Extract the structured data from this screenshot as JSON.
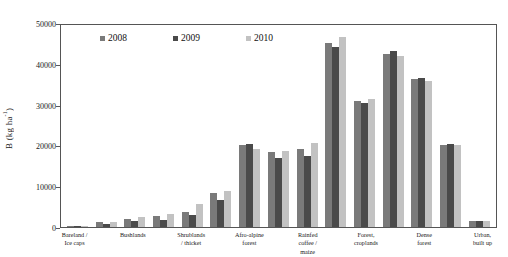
{
  "chart_data": {
    "type": "bar",
    "title": "",
    "xlabel": "",
    "ylabel": "B (kg ha-1)",
    "ylim": [
      0,
      50000
    ],
    "yticks": [
      0,
      10000,
      20000,
      30000,
      40000,
      50000
    ],
    "ytick_labels": [
      "0",
      "10000",
      "20000",
      "30000",
      "40000",
      "50000"
    ],
    "grid": false,
    "legend_position": "top-center",
    "categories": [
      "Bareland / Ice caps",
      "",
      "Bushlands",
      "",
      "Shrublands / thicket",
      "",
      "Afro-alpine forest",
      "",
      "Rainfed coffee / maize",
      "",
      "Forest, croplands",
      "",
      "Dense forest",
      "",
      "Urban, built up"
    ],
    "series": [
      {
        "name": "2008",
        "color": "#7a7a7a",
        "values": [
          150,
          1150,
          1950,
          2700,
          3800,
          8400,
          20100,
          18500,
          19100,
          45000,
          30800,
          42500,
          36200,
          20100,
          1500
        ]
      },
      {
        "name": "2009",
        "color": "#4a4a4a",
        "values": [
          120,
          700,
          1450,
          1750,
          2900,
          6500,
          20300,
          17000,
          17500,
          44200,
          30300,
          43100,
          36600,
          20400,
          1550
        ]
      },
      {
        "name": "2010",
        "color": "#c2c2c2",
        "values": [
          160,
          1300,
          2350,
          3150,
          5700,
          8750,
          19100,
          18600,
          20600,
          46500,
          31400,
          41800,
          35700,
          20000,
          1450
        ]
      }
    ],
    "xtick_labels_displayed": [
      "Bareland / Ice caps",
      "Bushlands",
      "Shrublands / thicket",
      "Afro-alpine forest",
      "Rainfed coffee / maize",
      "Forest, croplands",
      "Dense forest",
      "Urban, built up"
    ]
  },
  "axis": {
    "y_label_main": "B (kg ha",
    "y_label_sup": "-1",
    "y_label_close": ")"
  },
  "legend": {
    "items": [
      {
        "label": "2008",
        "color": "#7a7a7a"
      },
      {
        "label": "2009",
        "color": "#4a4a4a"
      },
      {
        "label": "2010",
        "color": "#c2c2c2"
      }
    ]
  }
}
